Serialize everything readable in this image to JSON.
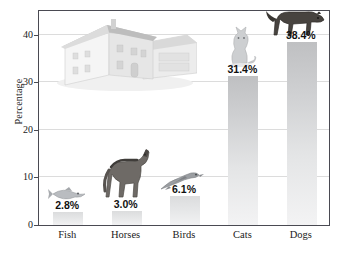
{
  "chart_data": {
    "type": "bar",
    "title": "",
    "xlabel": "",
    "ylabel": "Percentage",
    "categories": [
      "Fish",
      "Horses",
      "Birds",
      "Cats",
      "Dogs"
    ],
    "values": [
      2.8,
      3.0,
      6.1,
      31.4,
      38.4
    ],
    "data_labels": [
      "2.8%",
      "3.0%",
      "6.1%",
      "31.4%",
      "38.4%"
    ],
    "ylim": [
      0,
      45
    ],
    "yticks": [
      0,
      10,
      20,
      30,
      40
    ],
    "ytick_labels": [
      "0",
      "10",
      "20",
      "30",
      "40"
    ],
    "grid": "horizontal",
    "legend": "none",
    "bar_color": "#cfd0d2",
    "frame_color": "#4a4a52",
    "gridline_color": "#dcdcdc",
    "background": "#ffffff"
  },
  "axes": {
    "y_label": "Percentage",
    "y_ticks": [
      "40",
      "30",
      "20",
      "10",
      "0"
    ]
  },
  "bars": [
    {
      "category": "Fish",
      "label": "2.8%",
      "value": 2.8
    },
    {
      "category": "Horses",
      "label": "3.0%",
      "value": 3.0
    },
    {
      "category": "Birds",
      "label": "6.1%",
      "value": 6.1
    },
    {
      "category": "Cats",
      "label": "31.4%",
      "value": 31.4
    },
    {
      "category": "Dogs",
      "label": "38.4%",
      "value": 38.4
    }
  ],
  "illustrations": [
    {
      "name": "house-illustration",
      "subject": "House"
    },
    {
      "name": "fish-illustration",
      "subject": "Fish"
    },
    {
      "name": "horse-illustration",
      "subject": "Horse"
    },
    {
      "name": "bird-illustration",
      "subject": "Bird"
    },
    {
      "name": "cat-illustration",
      "subject": "Cat"
    },
    {
      "name": "dog-illustration",
      "subject": "Dog"
    }
  ]
}
